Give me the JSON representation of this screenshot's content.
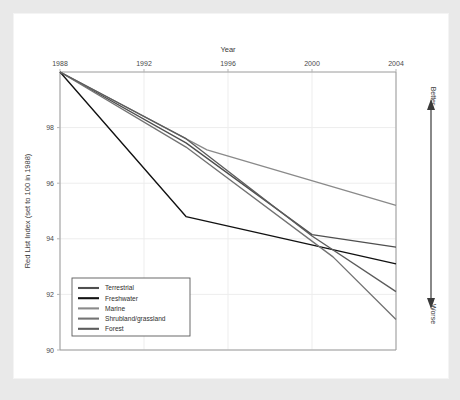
{
  "panel": {
    "background_color": "#ffffff",
    "outer_background_color": "#e9e9e9"
  },
  "annotations": {
    "better_label": "Better",
    "worse_label": "Worse",
    "arrow_name": "better-worse-arrow"
  },
  "chart_data": {
    "type": "line",
    "title": "",
    "xlabel": "Year",
    "ylabel": "Red List Index (set to 100 in 1988)",
    "x": [
      1988,
      1994,
      1995,
      2000,
      2001,
      2004
    ],
    "xticks": [
      1988,
      1992,
      1996,
      2000,
      2004
    ],
    "yticks": [
      98,
      96,
      94,
      92,
      90
    ],
    "xlim": [
      1988,
      2004
    ],
    "ylim": [
      90,
      100
    ],
    "grid": true,
    "x_axis_position": "top",
    "legend_position": "bottom-left",
    "series": [
      {
        "name": "Terrestrial",
        "color": "#4f4f4f",
        "x": [
          1988,
          1994,
          2000,
          2004
        ],
        "values": [
          100,
          97.45,
          94.15,
          93.7
        ]
      },
      {
        "name": "Freshwater",
        "color": "#111111",
        "x": [
          1988,
          1994,
          2004
        ],
        "values": [
          100,
          94.8,
          93.1
        ]
      },
      {
        "name": "Marine",
        "color": "#8a8a8a",
        "x": [
          1988,
          1995,
          2004
        ],
        "values": [
          100,
          97.2,
          95.2
        ]
      },
      {
        "name": "Shrubland/grassland",
        "color": "#737373",
        "x": [
          1988,
          1994,
          2001,
          2004
        ],
        "values": [
          100,
          97.3,
          93.35,
          91.1
        ]
      },
      {
        "name": "Forest",
        "color": "#5c5c5c",
        "x": [
          1988,
          1994,
          2000,
          2004
        ],
        "values": [
          100,
          97.6,
          94.1,
          92.1
        ]
      }
    ]
  }
}
